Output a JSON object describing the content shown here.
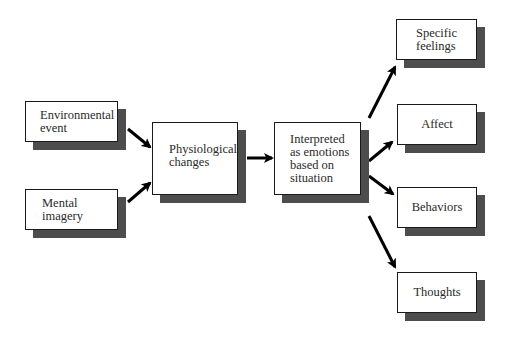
{
  "diagram": {
    "type": "flowchart",
    "nodes": {
      "environmental_event": "Environmental\nevent",
      "mental_imagery": "Mental\nimagery",
      "physiological_changes": "Physiological\nchanges",
      "interpreted": "Interpreted\nas emotions\nbased on\nsituation",
      "specific_feelings": "Specific\nfeelings",
      "affect": "Affect",
      "behaviors": "Behaviors",
      "thoughts": "Thoughts"
    },
    "edges": [
      {
        "from": "environmental_event",
        "to": "physiological_changes"
      },
      {
        "from": "mental_imagery",
        "to": "physiological_changes"
      },
      {
        "from": "physiological_changes",
        "to": "interpreted"
      },
      {
        "from": "interpreted",
        "to": "specific_feelings"
      },
      {
        "from": "interpreted",
        "to": "affect"
      },
      {
        "from": "interpreted",
        "to": "behaviors"
      },
      {
        "from": "interpreted",
        "to": "thoughts"
      }
    ],
    "colors": {
      "box_fill": "#ffffff",
      "box_border": "#1a1a1a",
      "shadow": "#4d4d4d",
      "arrow": "#000000"
    }
  }
}
